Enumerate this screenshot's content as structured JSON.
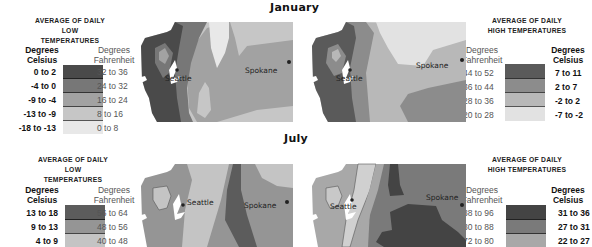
{
  "titles": {
    "january": "January",
    "july": "July"
  },
  "legends": {
    "jan_low": {
      "title_line1": "AVERAGE OF DAILY",
      "title_line2": "LOW TEMPERATURES",
      "celsius_head_1": "Degrees",
      "celsius_head_2": "Celsius",
      "fahrenheit_head_1": "Degrees",
      "fahrenheit_head_2": "Fahrenheit",
      "rows": [
        {
          "celsius": "0 to 2",
          "fahrenheit": "32 to 36",
          "color": "#4a4a4a"
        },
        {
          "celsius": "-4 to 0",
          "fahrenheit": "24 to 32",
          "color": "#777777"
        },
        {
          "celsius": "-9 to -4",
          "fahrenheit": "16 to 24",
          "color": "#a2a2a2"
        },
        {
          "celsius": "-13 to -9",
          "fahrenheit": "8 to 16",
          "color": "#c6c6c6"
        },
        {
          "celsius": "-18 to -13",
          "fahrenheit": "0 to 8",
          "color": "#e8e8e8"
        }
      ]
    },
    "jan_high": {
      "title_line1": "AVERAGE OF DAILY",
      "title_line2": "HIGH TEMPERATURES",
      "fahrenheit_head_1": "Degrees",
      "fahrenheit_head_2": "Fahrenheit",
      "celsius_head_1": "Degrees",
      "celsius_head_2": "Celsius",
      "rows": [
        {
          "fahrenheit": "44 to 52",
          "celsius": "7 to 11",
          "color": "#5a5a5a"
        },
        {
          "fahrenheit": "36 to 44",
          "celsius": "2 to 7",
          "color": "#8c8c8c"
        },
        {
          "fahrenheit": "28 to 36",
          "celsius": "-2 to 2",
          "color": "#b8b8b8"
        },
        {
          "fahrenheit": "20 to 28",
          "celsius": "-7 to -2",
          "color": "#e2e2e2"
        }
      ]
    },
    "jul_low": {
      "title_line1": "AVERAGE OF DAILY",
      "title_line2": "LOW TEMPERATURES",
      "celsius_head_1": "Degrees",
      "celsius_head_2": "Celsius",
      "fahrenheit_head_1": "Degrees",
      "fahrenheit_head_2": "Fahrenheit",
      "rows": [
        {
          "celsius": "13 to 18",
          "fahrenheit": "56 to 64",
          "color": "#5c5c5c"
        },
        {
          "celsius": "9 to 13",
          "fahrenheit": "48 to 56",
          "color": "#959595"
        },
        {
          "celsius": "4 to 9",
          "fahrenheit": "40 to 48",
          "color": "#c4c4c4"
        }
      ]
    },
    "jul_high": {
      "title_line1": "AVERAGE OF DAILY",
      "title_line2": "HIGH TEMPERATURES",
      "fahrenheit_head_1": "Degrees",
      "fahrenheit_head_2": "Fahrenheit",
      "celsius_head_1": "Degrees",
      "celsius_head_2": "Celsius",
      "rows": [
        {
          "fahrenheit": "88 to 96",
          "celsius": "31 to 36",
          "color": "#444444"
        },
        {
          "fahrenheit": "80 to 88",
          "celsius": "27 to 31",
          "color": "#7a7a7a"
        },
        {
          "fahrenheit": "72 to 80",
          "celsius": "22 to 27",
          "color": "#a8a8a8"
        }
      ]
    }
  },
  "maps": {
    "jan_low": {
      "city1": "Seattle",
      "city2": "Spokane"
    },
    "jan_high": {
      "city1": "Seattle",
      "city2": "Spokane"
    },
    "jul_low": {
      "city1": "Seattle",
      "city2": "Spokane"
    },
    "jul_high": {
      "city1": "Seattle",
      "city2": "Spokane"
    }
  }
}
